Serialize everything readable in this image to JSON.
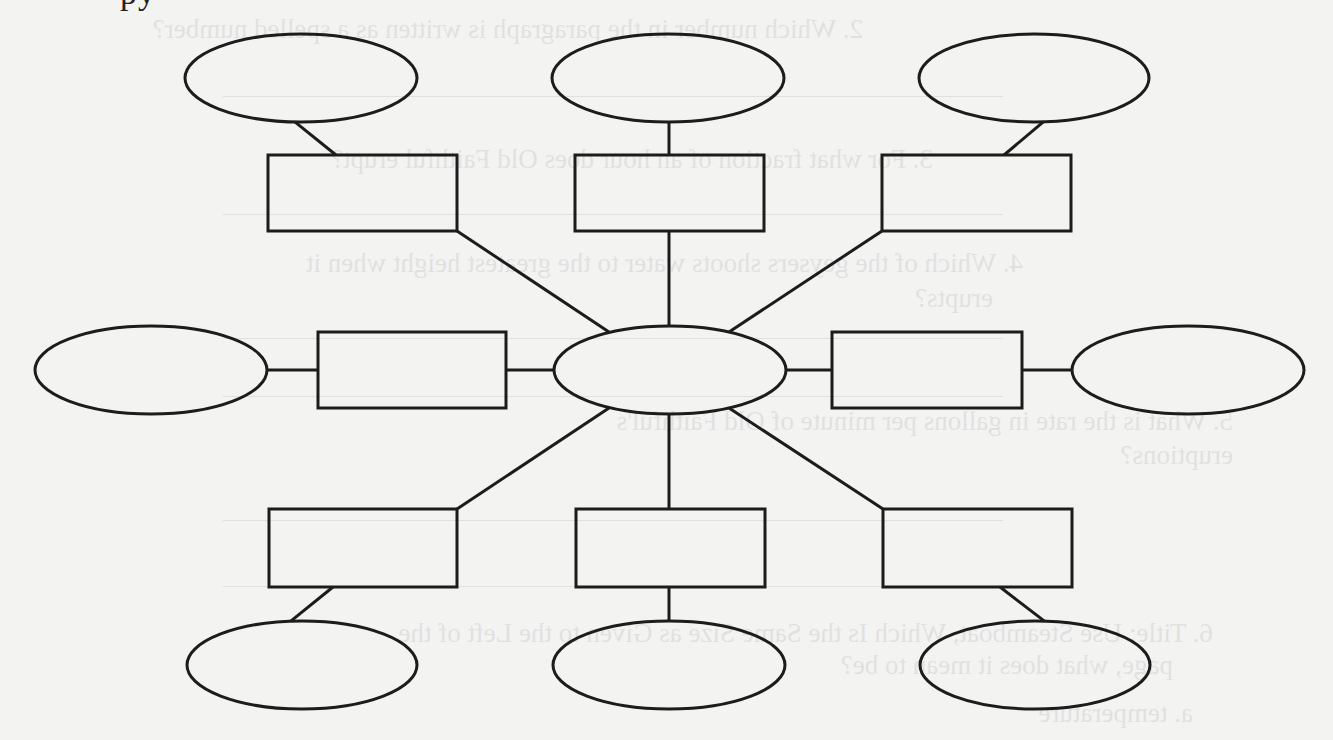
{
  "page": {
    "background_color": "#f3f3f2",
    "stroke_color": "#1c1c1c",
    "cut_off_header_text": "py"
  },
  "diagram": {
    "type": "concept-web",
    "center": {
      "shape": "ellipse",
      "label": "",
      "cx": 670,
      "cy": 370,
      "rx": 116,
      "ry": 44
    },
    "branches": [
      {
        "position": "top-left",
        "rect": {
          "x": 268,
          "y": 155,
          "w": 189,
          "h": 76,
          "label": ""
        },
        "oval": {
          "cx": 301,
          "cy": 78,
          "rx": 116,
          "ry": 44,
          "label": ""
        }
      },
      {
        "position": "top-center",
        "rect": {
          "x": 575,
          "y": 155,
          "w": 189,
          "h": 76,
          "label": ""
        },
        "oval": {
          "cx": 668,
          "cy": 78,
          "rx": 116,
          "ry": 44,
          "label": ""
        }
      },
      {
        "position": "top-right",
        "rect": {
          "x": 882,
          "y": 155,
          "w": 189,
          "h": 76,
          "label": ""
        },
        "oval": {
          "cx": 1034,
          "cy": 78,
          "rx": 115,
          "ry": 44,
          "label": ""
        }
      },
      {
        "position": "middle-left",
        "rect": {
          "x": 318,
          "y": 332,
          "w": 188,
          "h": 76,
          "label": ""
        },
        "oval": {
          "cx": 151,
          "cy": 370,
          "rx": 116,
          "ry": 44,
          "label": ""
        }
      },
      {
        "position": "middle-right",
        "rect": {
          "x": 832,
          "y": 332,
          "w": 190,
          "h": 76,
          "label": ""
        },
        "oval": {
          "cx": 1188,
          "cy": 370,
          "rx": 116,
          "ry": 44,
          "label": ""
        }
      },
      {
        "position": "bottom-left",
        "rect": {
          "x": 269,
          "y": 509,
          "w": 188,
          "h": 78,
          "label": ""
        },
        "oval": {
          "cx": 302,
          "cy": 665,
          "rx": 115,
          "ry": 44,
          "label": ""
        }
      },
      {
        "position": "bottom-center",
        "rect": {
          "x": 576,
          "y": 509,
          "w": 189,
          "h": 78,
          "label": ""
        },
        "oval": {
          "cx": 669,
          "cy": 665,
          "rx": 116,
          "ry": 44,
          "label": ""
        }
      },
      {
        "position": "bottom-right",
        "rect": {
          "x": 883,
          "y": 509,
          "w": 189,
          "h": 78,
          "label": ""
        },
        "oval": {
          "cx": 1035,
          "cy": 665,
          "rx": 115,
          "ry": 44,
          "label": ""
        }
      }
    ]
  },
  "bleed_through": {
    "note": "faint mirrored text from reverse side of page",
    "lines": [
      {
        "x": 470,
        "y": 36,
        "text": "2. Which number in the paragraph is written as a spelled number?"
      },
      {
        "x": 400,
        "y": 166,
        "text": "3. For what fraction of an hour does Old Faithful erupt?"
      },
      {
        "x": 310,
        "y": 270,
        "text": "4. Which of the geysers shoots water to the greatest height when it"
      },
      {
        "x": 340,
        "y": 305,
        "text": "erupts?"
      },
      {
        "x": 100,
        "y": 428,
        "text": "5. What is the rate in gallons per minute of Old Faithful's"
      },
      {
        "x": 100,
        "y": 462,
        "text": "eruptions?"
      },
      {
        "x": 120,
        "y": 640,
        "text": "6. Title: Use Steamboat, Which Is the Same Size as Given to the Left of the"
      },
      {
        "x": 160,
        "y": 672,
        "text": "page, what does it mean to be?"
      },
      {
        "x": 140,
        "y": 720,
        "text": "a. temperature"
      }
    ],
    "rules_y": [
      96,
      214,
      338,
      396,
      520,
      586
    ]
  }
}
